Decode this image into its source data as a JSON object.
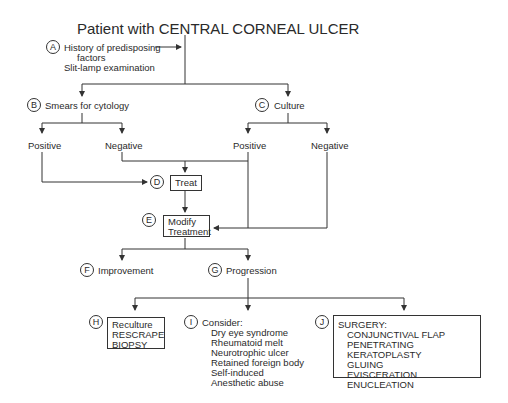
{
  "title": "Patient with CENTRAL CORNEAL ULCER",
  "nodes": {
    "A": {
      "letter": "A",
      "lines": [
        "History of predisposing",
        "factors",
        "Slit-lamp examination"
      ]
    },
    "B": {
      "letter": "B",
      "label": "Smears for cytology",
      "positive": "Positive",
      "negative": "Negative"
    },
    "C": {
      "letter": "C",
      "label": "Culture",
      "positive": "Positive",
      "negative": "Negative"
    },
    "D": {
      "letter": "D",
      "label": "Treat"
    },
    "E": {
      "letter": "E",
      "line1": "Modify",
      "line2": "Treatment"
    },
    "F": {
      "letter": "F",
      "label": "Improvement"
    },
    "G": {
      "letter": "G",
      "label": "Progression"
    },
    "H": {
      "letter": "H",
      "lines": [
        "Reculture",
        "RESCRAPE",
        "BIOPSY"
      ]
    },
    "I": {
      "letter": "I",
      "header": "Consider:",
      "items": [
        "Dry eye syndrome",
        "Rheumatoid melt",
        "Neurotrophic ulcer",
        "Retained foreign body",
        "Self-induced",
        "Anesthetic abuse"
      ]
    },
    "J": {
      "letter": "J",
      "header": "SURGERY:",
      "items": [
        "CONJUNCTIVAL FLAP",
        "PENETRATING KERATOPLASTY",
        "GLUING",
        "EVISCERATION",
        "ENUCLEATION"
      ]
    }
  }
}
